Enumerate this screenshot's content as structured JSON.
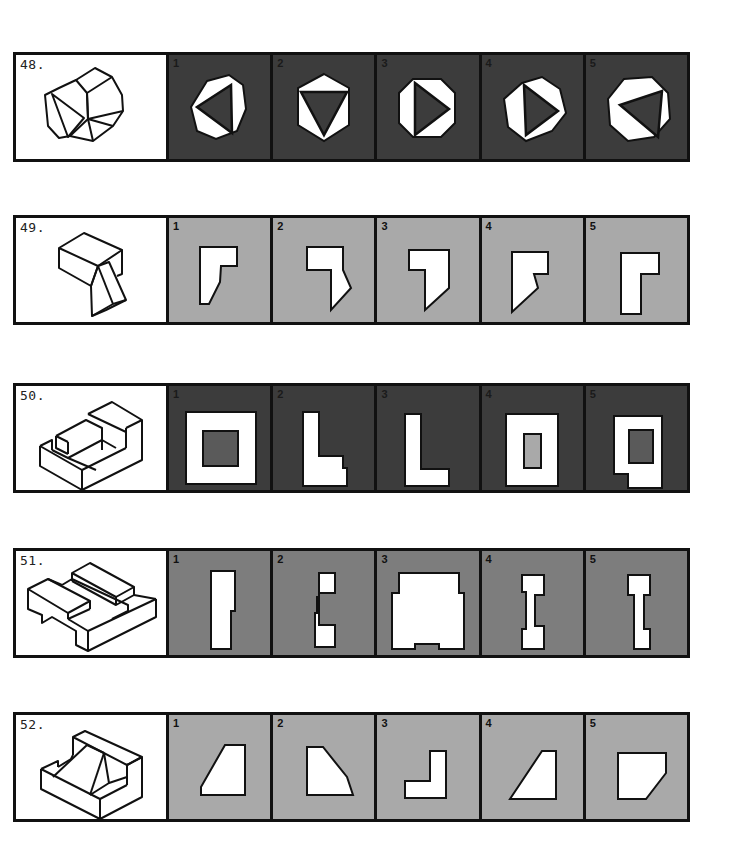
{
  "document": {
    "type": "spatial-reasoning-test-page",
    "colors": {
      "border": "#111111",
      "stem_background": "#ffffff",
      "shape_fill": "#ffffff",
      "option_bg_dark": "#3c3c3c",
      "option_bg_mid": "#7d7d7d",
      "option_bg_light": "#a9a9a9"
    }
  },
  "questions": [
    {
      "number": "48.",
      "stem": "isometric octagonal prism with triangular recess on front face",
      "option_background": "dark",
      "options": [
        {
          "label": "1",
          "shape": "octagon with triangle pointing left"
        },
        {
          "label": "2",
          "shape": "hexagon with triangle pointing down"
        },
        {
          "label": "3",
          "shape": "octagon with triangle pointing right"
        },
        {
          "label": "4",
          "shape": "heptagon with triangle pointing right"
        },
        {
          "label": "5",
          "shape": "octagon with triangle pointing left, offset"
        }
      ]
    },
    {
      "number": "49.",
      "stem": "isometric block with angled extension below",
      "option_background": "light",
      "options": [
        {
          "label": "1",
          "shape": "L-shape with angled bottom-left"
        },
        {
          "label": "2",
          "shape": "hook shape with angled right side"
        },
        {
          "label": "3",
          "shape": "reversed 7 shape with angled bottom"
        },
        {
          "label": "4",
          "shape": "notched shape with angled left"
        },
        {
          "label": "5",
          "shape": "L-shape rectangular"
        }
      ]
    },
    {
      "number": "50.",
      "stem": "isometric stepped block with slot",
      "option_background": "dark",
      "options": [
        {
          "label": "1",
          "shape": "square with square hole"
        },
        {
          "label": "2",
          "shape": "L-shape with notch"
        },
        {
          "label": "3",
          "shape": "L-shape"
        },
        {
          "label": "4",
          "shape": "rectangle with rectangular hole"
        },
        {
          "label": "5",
          "shape": "notched rectangle with hole"
        }
      ]
    },
    {
      "number": "51.",
      "stem": "isometric plate with raised bars and notch",
      "option_background": "mid",
      "options": [
        {
          "label": "1",
          "shape": "tall rectangle with step"
        },
        {
          "label": "2",
          "shape": "bracket shape"
        },
        {
          "label": "3",
          "shape": "wide shape with side steps and bottom notch"
        },
        {
          "label": "4",
          "shape": "I-beam shape"
        },
        {
          "label": "5",
          "shape": "narrow I-beam shape"
        }
      ]
    },
    {
      "number": "52.",
      "stem": "isometric L-block with triangular rib",
      "option_background": "light",
      "options": [
        {
          "label": "1",
          "shape": "trapezoid slanted left"
        },
        {
          "label": "2",
          "shape": "pentagon with chamfered right"
        },
        {
          "label": "3",
          "shape": "reversed L-shape"
        },
        {
          "label": "4",
          "shape": "right trapezoid slanted"
        },
        {
          "label": "5",
          "shape": "pentagon with chamfered bottom-right"
        }
      ]
    }
  ]
}
